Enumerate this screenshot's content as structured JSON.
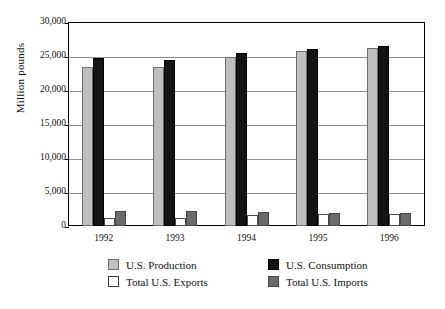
{
  "chart_data": {
    "type": "bar",
    "title": "",
    "subtitle": "",
    "xlabel": "",
    "ylabel": "Million pounds",
    "categories": [
      "1992",
      "1993",
      "1994",
      "1995",
      "1996"
    ],
    "ylim": [
      0,
      30000
    ],
    "ytick_values": [
      0,
      5000,
      10000,
      15000,
      20000,
      25000,
      30000
    ],
    "ytick_labels": [
      "0",
      "5,000",
      "10,000",
      "15,000",
      "20,000",
      "25,000",
      "30,000"
    ],
    "grid": true,
    "legend_position": "bottom",
    "series": [
      {
        "name": "U.S. Production",
        "color": "#bfbfbf",
        "values": [
          23400,
          23400,
          24800,
          25700,
          26200
        ]
      },
      {
        "name": "U.S. Consumption",
        "color": "#141414",
        "values": [
          24700,
          24400,
          25500,
          26000,
          26400
        ]
      },
      {
        "name": "Total U.S. Exports",
        "color": "#ffffff",
        "values": [
          1250,
          1200,
          1600,
          1800,
          1800
        ]
      },
      {
        "name": "Total U.S. Imports",
        "color": "#6b6b6b",
        "values": [
          2150,
          2150,
          2100,
          1950,
          1900
        ]
      }
    ]
  },
  "axis": {
    "y_title": "Million pounds"
  },
  "legend": {
    "entries": [
      {
        "label": "U.S. Production",
        "swatch": "production"
      },
      {
        "label": "U.S. Consumption",
        "swatch": "consumption"
      },
      {
        "label": "Total U.S. Exports",
        "swatch": "exports"
      },
      {
        "label": "Total U.S. Imports",
        "swatch": "imports"
      }
    ]
  }
}
